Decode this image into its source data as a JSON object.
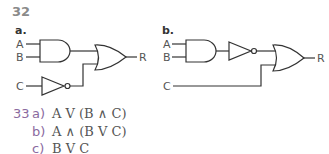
{
  "question_32": {
    "number": "32",
    "part_a": {
      "label": "a.",
      "inputs": [
        "A",
        "B",
        "C"
      ],
      "output": "R",
      "gates": [
        "AND(A,B)",
        "NOT(C)",
        "OR(AND, NOT)"
      ]
    },
    "part_b": {
      "label": "b.",
      "inputs": [
        "A",
        "B",
        "C"
      ],
      "output": "R",
      "gates": [
        "AND(A,B)",
        "NOT(AND)",
        "OR(NOT, C)"
      ]
    }
  },
  "question_33": {
    "number": "33",
    "answers": [
      {
        "label": "a)",
        "expression": "A V (B ∧ C)"
      },
      {
        "label": "b)",
        "expression": "A ∧ (B V C)"
      },
      {
        "label": "c)",
        "expression": "B V C"
      }
    ]
  },
  "colors": {
    "wire": "#333333",
    "question_number": "#8a8a8a",
    "answer_label": "#8a6aa0"
  }
}
